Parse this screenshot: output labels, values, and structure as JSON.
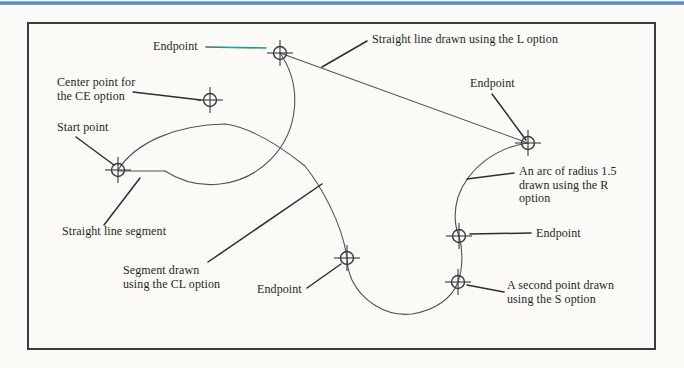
{
  "page": {
    "background": "#fbfaf6",
    "accent_rule_color": "#4a7ec0"
  },
  "figure": {
    "width": 684,
    "height": 368,
    "border": {
      "x": 28,
      "y": 23,
      "w": 627,
      "h": 326,
      "color": "#3c3c3c"
    },
    "colors": {
      "curve": "#515151",
      "leader": "#2e2e2e",
      "marker": "#3a3a3a",
      "teal_leader": "#21a5a0",
      "text": "#1f1f1f"
    },
    "paths": [
      {
        "name": "straight-line-segment-path",
        "d": "M 118 171 L 165 171"
      },
      {
        "name": "ce-option-arc-path",
        "d": "M 165 171 A 84 84 0 0 0 280 53"
      },
      {
        "name": "l-option-line-path",
        "d": "M 280 53 L 528 143"
      },
      {
        "name": "r-option-arc-path",
        "d": "M 528 143 C 497 147 468 168 458 197 C 454 211 454 224 459 236"
      },
      {
        "name": "s-option-arc-upper-path",
        "d": "M 459 236 C 463 250 463 268 458 282"
      },
      {
        "name": "s-option-arc-lower-path",
        "d": "M 458 282 C 452 298 436 310 412 314 C 384 317 361 299 352 280 C 348 271 347 266 347 258"
      },
      {
        "name": "cl-close-arc-path",
        "d": "M 118 170 C 136 142 176 125 225 124 C 255 128 285 150 305 166 C 320 185 342 222 347 258"
      }
    ],
    "leaders": [
      {
        "name": "leader-endpoint-top",
        "x1": 206,
        "y1": 47,
        "x2": 266,
        "y2": 48,
        "teal": true
      },
      {
        "name": "leader-l-option",
        "x1": 367,
        "y1": 41,
        "x2": 322,
        "y2": 67
      },
      {
        "name": "leader-ce-center",
        "x1": 133,
        "y1": 92,
        "x2": 201,
        "y2": 100
      },
      {
        "name": "leader-endpoint-upper-right",
        "x1": 492,
        "y1": 94,
        "x2": 526,
        "y2": 140
      },
      {
        "name": "leader-start-point",
        "x1": 76,
        "y1": 137,
        "x2": 114,
        "y2": 165
      },
      {
        "name": "leader-straight-line-segment",
        "x1": 104,
        "y1": 225,
        "x2": 140,
        "y2": 178
      },
      {
        "name": "leader-cl-option",
        "x1": 208,
        "y1": 262,
        "x2": 322,
        "y2": 184
      },
      {
        "name": "leader-endpoint-bottom",
        "x1": 307,
        "y1": 288,
        "x2": 341,
        "y2": 264
      },
      {
        "name": "leader-r-option",
        "x1": 514,
        "y1": 173,
        "x2": 467,
        "y2": 179
      },
      {
        "name": "leader-endpoint-arc",
        "x1": 531,
        "y1": 233,
        "x2": 470,
        "y2": 234
      },
      {
        "name": "leader-s-option",
        "x1": 504,
        "y1": 292,
        "x2": 467,
        "y2": 285
      }
    ],
    "markers": [
      {
        "name": "marker-endpoint-top",
        "x": 280,
        "y": 53
      },
      {
        "name": "marker-ce-center-point",
        "x": 210,
        "y": 100
      },
      {
        "name": "marker-start-point",
        "x": 118,
        "y": 170
      },
      {
        "name": "marker-endpoint-right",
        "x": 528,
        "y": 143
      },
      {
        "name": "marker-endpoint-bottom",
        "x": 347,
        "y": 258
      },
      {
        "name": "marker-endpoint-arc-end",
        "x": 459,
        "y": 236
      },
      {
        "name": "marker-second-point",
        "x": 458,
        "y": 282
      }
    ],
    "labels": [
      {
        "name": "label-endpoint-top",
        "x": 153,
        "y": 40,
        "lines": [
          "Endpoint"
        ]
      },
      {
        "name": "label-l-option",
        "x": 372,
        "y": 33,
        "lines": [
          "Straight line drawn using the L option"
        ]
      },
      {
        "name": "label-ce-center",
        "x": 57,
        "y": 76,
        "lines": [
          "Center point for",
          "the CE option"
        ]
      },
      {
        "name": "label-endpoint-upper-right",
        "x": 470,
        "y": 77,
        "lines": [
          "Endpoint"
        ]
      },
      {
        "name": "label-start-point",
        "x": 57,
        "y": 121,
        "lines": [
          "Start point"
        ]
      },
      {
        "name": "label-straight-line-segment",
        "x": 62,
        "y": 225,
        "lines": [
          "Straight line segment"
        ]
      },
      {
        "name": "label-cl-option",
        "x": 123,
        "y": 264,
        "lines": [
          "Segment drawn",
          "using the CL option"
        ]
      },
      {
        "name": "label-endpoint-bottom",
        "x": 257,
        "y": 283,
        "lines": [
          "Endpoint"
        ]
      },
      {
        "name": "label-r-option",
        "x": 519,
        "y": 165,
        "lines": [
          "An arc of radius 1.5",
          "drawn using the R",
          "option"
        ]
      },
      {
        "name": "label-endpoint-arc-end",
        "x": 536,
        "y": 227,
        "lines": [
          "Endpoint"
        ]
      },
      {
        "name": "label-s-option",
        "x": 507,
        "y": 279,
        "lines": [
          "A second point drawn",
          "using the S option"
        ]
      }
    ]
  }
}
